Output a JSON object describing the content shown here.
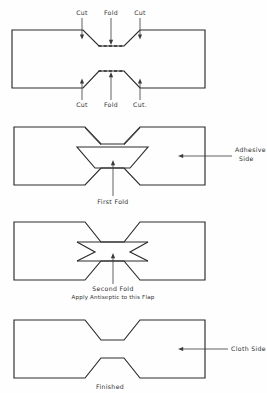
{
  "document": {
    "title": "Bandage Folding Instructions",
    "background_color": "#fefefe",
    "ink_color": "#2a2a2a"
  },
  "panels": [
    {
      "id": "panel-1",
      "name": "flat-pattern",
      "caption": "",
      "labels": {
        "top_left": "Cut",
        "top_center": "Fold",
        "top_right": "Cut",
        "bottom_left": "Cut",
        "bottom_center": "Fold",
        "bottom_right": "Cut."
      }
    },
    {
      "id": "panel-2",
      "name": "first-fold",
      "caption": "First Fold",
      "side_label_line1": "Adhesive",
      "side_label_line2": "Side"
    },
    {
      "id": "panel-3",
      "name": "second-fold",
      "caption_line1": "Second  Fold",
      "caption_line2": "Apply Antiseptic to this Flap"
    },
    {
      "id": "panel-4",
      "name": "finished",
      "caption": "Finished",
      "side_label": "Cloth Side"
    }
  ]
}
